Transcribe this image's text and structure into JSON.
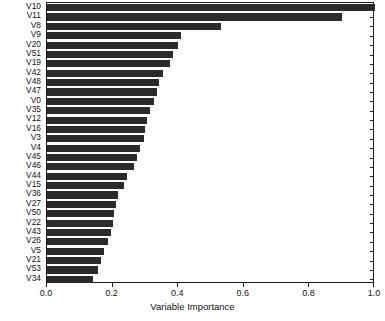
{
  "chart_data": {
    "type": "bar",
    "orientation": "horizontal",
    "title": "",
    "xlabel": "Variable Importance",
    "ylabel": "",
    "xlim": [
      0.0,
      1.0
    ],
    "xticks": [
      "0.0",
      "0.2",
      "0.4",
      "0.6",
      "0.8",
      "1.0"
    ],
    "xtick_values": [
      0.0,
      0.2,
      0.4,
      0.6,
      0.8,
      1.0
    ],
    "grid": false,
    "legend": null,
    "bar_color": "#2b2b2b",
    "axis_color": "#1a1a1a",
    "background": "#ffffff",
    "categories": [
      "V10",
      "V11",
      "V8",
      "V9",
      "V20",
      "V51",
      "V19",
      "V42",
      "V48",
      "V47",
      "V0",
      "V35",
      "V12",
      "V16",
      "V3",
      "V4",
      "V45",
      "V46",
      "V44",
      "V15",
      "V36",
      "V27",
      "V50",
      "V22",
      "V43",
      "V26",
      "V5",
      "V21",
      "V53",
      "V34"
    ],
    "values": [
      1.0,
      0.9,
      0.53,
      0.41,
      0.4,
      0.385,
      0.375,
      0.355,
      0.34,
      0.335,
      0.325,
      0.315,
      0.305,
      0.3,
      0.295,
      0.285,
      0.275,
      0.265,
      0.245,
      0.235,
      0.215,
      0.21,
      0.205,
      0.2,
      0.195,
      0.185,
      0.175,
      0.165,
      0.155,
      0.14
    ]
  },
  "axes": {
    "x_title": "Variable Importance"
  }
}
